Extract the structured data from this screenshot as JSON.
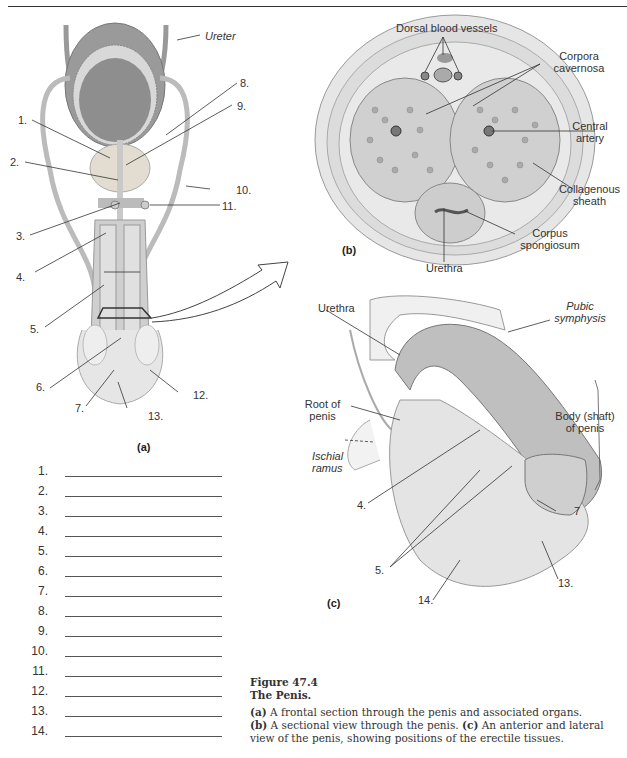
{
  "page": {
    "header_rule": true
  },
  "figure_a": {
    "tag": "(a)",
    "labels": {
      "ureter": "Ureter",
      "n1": "1.",
      "n2": "2.",
      "n3": "3.",
      "n4": "4.",
      "n5": "5.",
      "n6": "6.",
      "n7": "7.",
      "n8": "8.",
      "n9": "9.",
      "n10": "10.",
      "n11": "11.",
      "n12": "12.",
      "n13": "13."
    }
  },
  "figure_b": {
    "tag": "(b)",
    "labels": {
      "dorsal_blood_vessels": "Dorsal blood vessels",
      "corpora_cavernosa_1": "Corpora",
      "corpora_cavernosa_2": "cavernosa",
      "central_artery_1": "Central",
      "central_artery_2": "artery",
      "collagenous_sheath_1": "Collagenous",
      "collagenous_sheath_2": "sheath",
      "corpus_spongiosum_1": "Corpus",
      "corpus_spongiosum_2": "spongiosum",
      "urethra": "Urethra"
    }
  },
  "figure_c": {
    "tag": "(c)",
    "labels": {
      "urethra": "Urethra",
      "pubic_symphysis_1": "Pubic",
      "pubic_symphysis_2": "symphysis",
      "root_of_penis_1": "Root of",
      "root_of_penis_2": "penis",
      "body_shaft_1": "Body (shaft)",
      "body_shaft_2": "of  penis",
      "ischial_ramus_1": "Ischial",
      "ischial_ramus_2": "ramus",
      "n4": "4.",
      "n5": "5.",
      "n7": "7",
      "n13": "13.",
      "n14": "14."
    }
  },
  "answer_blanks": [
    {
      "num": "1.",
      "value": ""
    },
    {
      "num": "2.",
      "value": ""
    },
    {
      "num": "3.",
      "value": ""
    },
    {
      "num": "4.",
      "value": ""
    },
    {
      "num": "5.",
      "value": ""
    },
    {
      "num": "6.",
      "value": ""
    },
    {
      "num": "7.",
      "value": ""
    },
    {
      "num": "8.",
      "value": ""
    },
    {
      "num": "9.",
      "value": ""
    },
    {
      "num": "10.",
      "value": ""
    },
    {
      "num": "11.",
      "value": ""
    },
    {
      "num": "12.",
      "value": ""
    },
    {
      "num": "13.",
      "value": ""
    },
    {
      "num": "14.",
      "value": ""
    }
  ],
  "caption": {
    "figure_number": "Figure 47.4",
    "title": "The Penis.",
    "part_a_tag": "(a)",
    "part_a_text": " A frontal section through the penis and associated organs.",
    "part_b_tag": "(b)",
    "part_b_text": " A sectional view through the penis. ",
    "part_c_tag": "(c)",
    "part_c_text": " An anterior and lateral view of the penis, showing positions of the erectile tissues."
  }
}
